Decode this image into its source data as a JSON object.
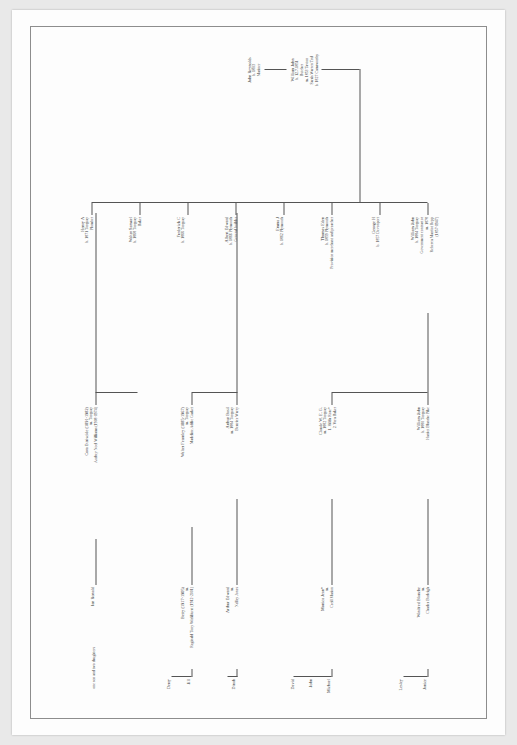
{
  "document": {
    "kind": "genealogy-chart",
    "orientation": "landscape-on-portrait",
    "ink_color": "#2c2c2c",
    "rule_color": "#6f6f6f",
    "page_background": "#fdfdfd",
    "border_color": "#8d8d8d"
  },
  "tree": {
    "root": {
      "name": "John Reynolds",
      "birth": "b. 1803",
      "occupation": "Mariner"
    },
    "gen2": {
      "name": "William John",
      "birth": "b. 12.7.1851",
      "occupation": "Butcher",
      "marriage": "m. 1853 Tavton",
      "spouse": "Sarah Warren Trul",
      "spouse_birth": "b. 1827 Camsworthy"
    },
    "gen3": [
      {
        "name": "William John",
        "birth": "b. 1884 Torquay",
        "occupation": "Government contractor",
        "extra1": "m. 1878",
        "extra2": "Rebecca Marriot Repp",
        "extra3": "(1857-1947)"
      },
      {
        "name": "George H",
        "birth": "b. 1857 Devonport",
        "occupation": ""
      },
      {
        "name": "Thomas Eden",
        "birth": "b. 1859 Plymouth",
        "occupation": "Provision merchant and preacher"
      },
      {
        "name": "Emma J",
        "birth": "b. 1862 Plymouth",
        "occupation": ""
      },
      {
        "name": "Albert Edward",
        "birth": "b. 1866 Plymouth",
        "occupation": "General builder"
      },
      {
        "name": "Frederick C",
        "birth": "b. 1866 Torquay",
        "occupation": ""
      },
      {
        "name": "Walter Samuel",
        "birth": "b. 1868 Torquay",
        "occupation": "Baker"
      },
      {
        "name": "Henry A",
        "birth": "b. 1871 Torquay",
        "occupation": "Plumber"
      }
    ],
    "gen4": [
      {
        "name": "William John",
        "birth": "b. 1880 Torquay",
        "spouse": "Harriet Blanche Pike"
      },
      {
        "name": "Claude W. E. G.",
        "marriage": "m. 1882 Torquay",
        "spouse1": "1. Hilda Rose*",
        "spouse2": "2. Vera Baker"
      },
      {
        "name": "Arthur Basil",
        "marriage": "m. 1884 Torquay",
        "spouse": "Beatrice Warry"
      },
      {
        "name": "Walter Fearnley (1885-1967)",
        "marriage": "m. Torquay",
        "spouse": "Madeline Addie Gasket"
      },
      {
        "name": "Cora Ettriscide (1891-1982)",
        "marriage": "m. Torquay",
        "spouse": "Audrey Noel Williams (1908-1974)"
      }
    ],
    "gen5": [
      {
        "name": "Winifred Blanche",
        "marriage": "m.",
        "spouse": "Charles Burleigh"
      },
      {
        "name": "Monica Jean*",
        "marriage": "m.",
        "spouse": "Cecil Marion"
      },
      {
        "name": "Arthur Edward",
        "marriage": "m.",
        "spouse": "Nelley Jones"
      },
      {
        "name": "Betty (1917-1905)",
        "marriage": "m.",
        "spouse": "Reginald Tony Wickliurst (1912-2001)"
      },
      {
        "name": "Ian Ronald",
        "note": "one son and two daughters"
      }
    ],
    "gen6": [
      {
        "name": "Janice"
      },
      {
        "name": "Lesley"
      },
      {
        "name": "Michael"
      },
      {
        "name": "John"
      },
      {
        "name": "David"
      },
      {
        "name": "Dinah"
      },
      {
        "name": "Jill"
      },
      {
        "name": "Derry"
      }
    ]
  }
}
